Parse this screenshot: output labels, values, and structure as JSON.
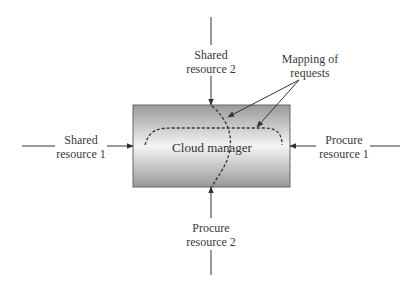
{
  "diagram": {
    "center": {
      "label": "Cloud manager"
    },
    "inputs": [
      {
        "id": "shared-resource-1",
        "line1": "Shared",
        "line2": "resource 1",
        "side": "left"
      },
      {
        "id": "shared-resource-2",
        "line1": "Shared",
        "line2": "resource 2",
        "side": "top"
      },
      {
        "id": "procure-resource-1",
        "line1": "Procure",
        "line2": "resource 1",
        "side": "right"
      },
      {
        "id": "procure-resource-2",
        "line1": "Procure",
        "line2": "resource 2",
        "side": "bottom"
      }
    ],
    "annotation": {
      "line1": "Mapping of",
      "line2": "requests"
    }
  },
  "colors": {
    "line": "#3a3a3a",
    "box_dark": "#9a9a9a",
    "box_light": "#f2f2f2"
  }
}
